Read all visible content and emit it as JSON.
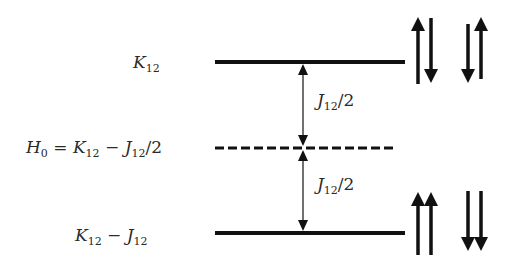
{
  "diagram": {
    "title": "",
    "levels": [
      {
        "id": "upper",
        "symbol": "K",
        "subscript": "12",
        "rest": "",
        "y": 62,
        "style": "solid"
      },
      {
        "id": "middle",
        "label_main": "H",
        "label_sub": "0",
        "eq": " = ",
        "k": "K",
        "k_sub": "12",
        "minus": " − ",
        "j": "J",
        "j_sub": "12",
        "tail": "/2",
        "y": 148,
        "style": "dashed"
      },
      {
        "id": "lower",
        "k": "K",
        "k_sub": "12",
        "minus": " − ",
        "j": "J",
        "j_sub": "12",
        "y": 233,
        "style": "solid"
      }
    ],
    "gaps": [
      {
        "j": "J",
        "sub": "12",
        "tail": "/2"
      },
      {
        "j": "J",
        "sub": "12",
        "tail": "/2"
      }
    ],
    "spin_states": {
      "upper": [
        "↑↓",
        "↓↑"
      ],
      "lower": [
        "↑↑",
        "↓↓"
      ]
    },
    "colors": {
      "line": "#111111",
      "text": "#2a2a2a",
      "background": "#ffffff"
    }
  }
}
